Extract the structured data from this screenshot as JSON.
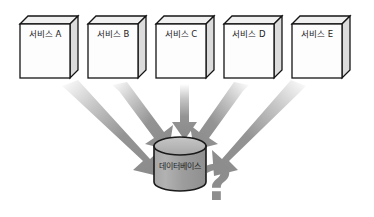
{
  "diagram": {
    "background_color": "#ffffff",
    "services": [
      {
        "label": "서비스 A",
        "x": 20,
        "y": 18,
        "w": 58,
        "h": 60
      },
      {
        "label": "서비스 B",
        "x": 88,
        "y": 18,
        "w": 58,
        "h": 60
      },
      {
        "label": "서비스 C",
        "x": 156,
        "y": 18,
        "w": 58,
        "h": 60
      },
      {
        "label": "서비스 D",
        "x": 224,
        "y": 18,
        "w": 58,
        "h": 60
      },
      {
        "label": "서비스 E",
        "x": 292,
        "y": 18,
        "w": 58,
        "h": 60
      }
    ],
    "database": {
      "label": "데이터베이스",
      "cx": 180,
      "cy": 164,
      "rx": 26,
      "body_top": 145,
      "body_bottom": 183,
      "fill_top": "#b8b8b8",
      "fill_body": "#9a9a9a",
      "stroke": "#1a1a1a"
    },
    "question_mark": {
      "text": "?",
      "x": 218,
      "y": 200,
      "color": "#8d8d8d"
    },
    "arrows": {
      "count": 5,
      "color": "#8a8a8a",
      "tail_fade": "#ffffff",
      "description": "five gray arrows converge from the five service boxes down onto the single database cylinder"
    },
    "colors": {
      "box_front": "#fdfdfd",
      "box_top": "#f0f0f0",
      "box_side": "#dcdcdc",
      "box_stroke": "#141414",
      "arrow": "#8a8a8a",
      "database": "#9a9a9a",
      "question": "#8d8d8d"
    }
  }
}
